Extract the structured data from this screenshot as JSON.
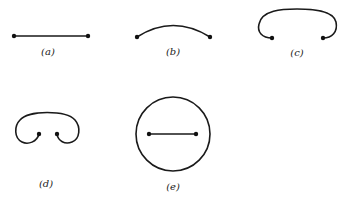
{
  "figure": {
    "panels": [
      {
        "id": "a",
        "label": "(a)",
        "shape": "straight segment with two endpoints"
      },
      {
        "id": "b",
        "label": "(b)",
        "shape": "shallow arc with two endpoints"
      },
      {
        "id": "c",
        "label": "(c)",
        "shape": "open loop, endpoints curled inward"
      },
      {
        "id": "d",
        "label": "(d)",
        "shape": "nearly closed loop, endpoints close together"
      },
      {
        "id": "e",
        "label": "(e)",
        "shape": "segment enclosed in a circle"
      }
    ],
    "colors": {
      "stroke": "#1a1a1a",
      "background": "#ffffff"
    }
  }
}
